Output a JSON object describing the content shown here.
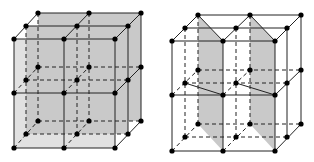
{
  "figure": {
    "colors": {
      "plane_fill": "#c9c9c9",
      "edge": "#222222",
      "atom": "#000000",
      "background": "#ffffff"
    },
    "lattices": [
      {
        "name": "left-lattice",
        "shaded_planes": "parallel planes at back and middle depth",
        "front_x": [
          14,
          64,
          115
        ],
        "front_y": [
          39,
          93,
          148
        ],
        "offset_per_depth": [
          12,
          -13
        ]
      },
      {
        "name": "right-lattice",
        "shaded_planes": "two diagonal planes",
        "front_x": [
          172,
          223,
          275
        ],
        "front_y": [
          41,
          95,
          151
        ],
        "offset_per_depth": [
          13,
          -13
        ]
      }
    ]
  }
}
